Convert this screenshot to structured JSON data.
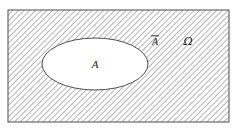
{
  "figure": {
    "type": "set-venn-diagram",
    "width": 237,
    "height": 131,
    "background_color": "#ffffff"
  },
  "universe": {
    "label": "Ω",
    "label_name": "omega-sample-space-label",
    "label_x": 188,
    "label_y": 45,
    "font_size": 11,
    "rect": {
      "x": 8,
      "y": 10,
      "width": 221,
      "height": 112
    },
    "border_color": "#4d4d4d",
    "border_width": 1,
    "fill_color": "#ffffff"
  },
  "hatching": {
    "pattern_name": "diagonal-hatch-pattern",
    "angle_degrees": 45,
    "spacing": 4,
    "line_color": "#5a5a5a",
    "line_width": 0.9
  },
  "set_a": {
    "label": "A",
    "label_name": "set-a-label",
    "label_x": 95,
    "label_y": 68,
    "font_size": 11,
    "ellipse": {
      "cx": 95,
      "cy": 64,
      "rx": 53,
      "ry": 26
    },
    "fill_color": "#ffffff",
    "border_color": "#4d4d4d",
    "border_width": 1
  },
  "complement": {
    "label": "A",
    "label_name": "complement-a-label",
    "overbar": true,
    "label_x": 155,
    "label_y": 45,
    "font_size": 10
  }
}
